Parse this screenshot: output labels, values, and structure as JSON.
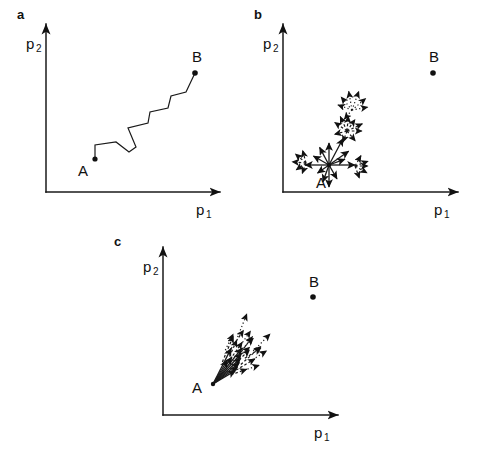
{
  "figure": {
    "axis_color": "#1a1a1a",
    "ink_color": "#111111",
    "background": "#ffffff"
  },
  "panels": [
    {
      "letter": "a",
      "caption": "random walk path from A to B",
      "axis": {
        "x_label": "p",
        "x_sub": "1",
        "y_label": "p",
        "y_sub": "2"
      },
      "points": [
        {
          "name": "A",
          "label": "A"
        },
        {
          "name": "B",
          "label": "B"
        }
      ]
    },
    {
      "letter": "b",
      "caption": "isotropic undirected sampling around A",
      "axis": {
        "x_label": "p",
        "x_sub": "1",
        "y_label": "p",
        "y_sub": "2"
      },
      "points": [
        {
          "name": "A",
          "label": "A"
        },
        {
          "name": "B",
          "label": "B"
        }
      ]
    },
    {
      "letter": "c",
      "caption": "directed sampling cone from A toward B",
      "axis": {
        "x_label": "p",
        "x_sub": "1",
        "y_label": "p",
        "y_sub": "2"
      },
      "points": [
        {
          "name": "A",
          "label": "A"
        },
        {
          "name": "B",
          "label": "B"
        }
      ]
    }
  ],
  "chart_data": {
    "type": "scatter",
    "xlabel": "p1",
    "ylabel": "p2",
    "grid": false,
    "legend": "none",
    "panels": [
      {
        "id": "a",
        "letter": "a",
        "type": "line",
        "description": "Zigzag random-walk trajectory connecting start point A to target point B.",
        "axes": {
          "origin": [
            46,
            192
          ],
          "x_axis_end": [
            227,
            192
          ],
          "y_axis_end": [
            46,
            17
          ],
          "xlabel": "p1",
          "ylabel": "p2"
        },
        "markers": [
          {
            "label": "A",
            "x": 95,
            "y": 159,
            "label_pos": [
              83,
              174
            ]
          },
          {
            "label": "B",
            "x": 195,
            "y": 73,
            "label_pos": [
              196,
              60
            ]
          }
        ],
        "path": [
          [
            95,
            159
          ],
          [
            95,
            145
          ],
          [
            116,
            142
          ],
          [
            129,
            152
          ],
          [
            136,
            147
          ],
          [
            128,
            128
          ],
          [
            148,
            123
          ],
          [
            150,
            112
          ],
          [
            168,
            108
          ],
          [
            171,
            96
          ],
          [
            186,
            92
          ],
          [
            195,
            73
          ]
        ]
      },
      {
        "id": "b",
        "letter": "b",
        "type": "vector-field",
        "description": "Undirected isotropic search: arrows radiate from A in all directions, with secondary dashed and dotted branches; target B lies far to the upper right and is not reached.",
        "axes": {
          "origin": [
            283,
            192
          ],
          "x_axis_end": [
            465,
            192
          ],
          "y_axis_end": [
            283,
            17
          ],
          "xlabel": "p1",
          "ylabel": "p2"
        },
        "markers": [
          {
            "label": "A",
            "x": 329,
            "y": 165,
            "label_pos": [
              320,
              184
            ]
          },
          {
            "label": "B",
            "x": 433,
            "y": 73,
            "label_pos": [
              433,
              59
            ]
          }
        ],
        "hubs": [
          {
            "origin": [
              329,
              165
            ],
            "style": "solid",
            "arrows_deg_len": [
              [
                0,
                26
              ],
              [
                35,
                24
              ],
              [
                62,
                30
              ],
              [
                90,
                22
              ],
              [
                118,
                20
              ],
              [
                150,
                18
              ],
              [
                180,
                24
              ],
              [
                215,
                14
              ],
              [
                250,
                18
              ],
              [
                270,
                22
              ],
              [
                300,
                16
              ],
              [
                20,
                17
              ]
            ]
          },
          {
            "origin": [
              347,
              131
            ],
            "style": "dashed",
            "arrows_deg_len": [
              [
                25,
                17
              ],
              [
                55,
                14
              ],
              [
                85,
                15
              ],
              [
                115,
                16
              ],
              [
                145,
                15
              ],
              [
                195,
                13
              ],
              [
                250,
                12
              ],
              [
                310,
                13
              ],
              [
                0,
                15
              ]
            ]
          },
          {
            "origin": [
              352,
              110
            ],
            "style": "dotted",
            "arrows_deg_len": [
              [
                40,
                18
              ],
              [
                70,
                20
              ],
              [
                100,
                19
              ],
              [
                130,
                17
              ],
              [
                160,
                15
              ],
              [
                10,
                16
              ],
              [
                230,
                12
              ]
            ]
          },
          {
            "origin": [
              306,
              163
            ],
            "style": "dashed",
            "arrows_deg_len": [
              [
                105,
                13
              ],
              [
                140,
                14
              ],
              [
                175,
                14
              ],
              [
                215,
                12
              ],
              [
                250,
                11
              ]
            ]
          },
          {
            "origin": [
              355,
              166
            ],
            "style": "dashed",
            "arrows_deg_len": [
              [
                20,
                14
              ],
              [
                330,
                14
              ],
              [
                290,
                13
              ],
              [
                60,
                12
              ],
              [
                0,
                13
              ]
            ]
          }
        ]
      },
      {
        "id": "c",
        "letter": "c",
        "type": "vector-field",
        "description": "Directed search: a narrow cone of arrows emanates from A pointing toward B, with dashed and dotted continuation arrows extending along the same bearing.",
        "axes": {
          "origin": [
            163,
            415
          ],
          "x_axis_end": [
            345,
            415
          ],
          "y_axis_end": [
            163,
            240
          ],
          "xlabel": "p1",
          "ylabel": "p2"
        },
        "markers": [
          {
            "label": "A",
            "x": 213,
            "y": 384,
            "label_pos": [
              196,
              391
            ]
          },
          {
            "label": "B",
            "x": 313,
            "y": 297,
            "label_pos": [
              314,
              283
            ]
          }
        ],
        "cone": {
          "apex": [
            213,
            384
          ],
          "mean_bearing_deg": 47,
          "half_angle_deg": 16,
          "solid_arrow_lengths": [
            26,
            30,
            34,
            38,
            42,
            46,
            33,
            28,
            40
          ],
          "dashed_arrow_count": 11,
          "dotted_arrow_count": 7
        }
      }
    ]
  }
}
